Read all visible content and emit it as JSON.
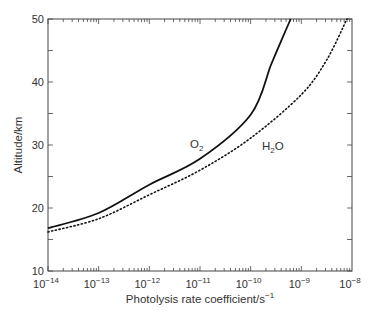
{
  "chart_data": {
    "type": "line",
    "title": "",
    "xlabel": "Photolysis rate coefficient/s^-1",
    "ylabel": "Altitude/km",
    "xscale": "log",
    "xlim": [
      1e-14,
      1e-08
    ],
    "ylim": [
      10,
      50
    ],
    "x_tick_labels": [
      "10^-14",
      "10^-13",
      "10^-12",
      "10^-11",
      "10^-10",
      "10^-9",
      "10^-8"
    ],
    "y_tick_labels": [
      "10",
      "20",
      "30",
      "40",
      "50"
    ],
    "grid": false,
    "legend": "inline labels",
    "series": [
      {
        "name": "O2",
        "style": "solid",
        "log10_x": [
          -14,
          -13,
          -12,
          -11,
          -10,
          -9.6,
          -9.4,
          -9.21
        ],
        "y": [
          16.8,
          19.2,
          23.7,
          27.8,
          34.8,
          42.7,
          46.5,
          50
        ]
      },
      {
        "name": "H2O",
        "style": "dotted",
        "log10_x": [
          -14,
          -13,
          -12,
          -11,
          -10,
          -9,
          -8.5,
          -8.1
        ],
        "y": [
          16.2,
          18.3,
          22.1,
          26.0,
          31.1,
          38.0,
          43.5,
          50
        ]
      }
    ],
    "annotations": [
      {
        "text": "O2",
        "near_series": "O2"
      },
      {
        "text": "H2O",
        "near_series": "H2O"
      }
    ]
  },
  "labels": {
    "xlabel_main": "Photolysis rate coefficient/s",
    "xlabel_sup": "−1",
    "ylabel": "Altitude/km",
    "o2_main": "O",
    "o2_sub": "2",
    "h2o_h": "H",
    "h2o_sub": "2",
    "h2o_o": "O"
  }
}
